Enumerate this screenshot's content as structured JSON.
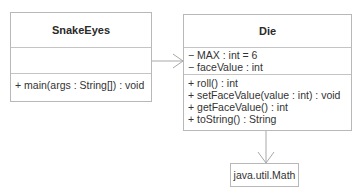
{
  "diagram": {
    "type": "UML class diagram",
    "classes": [
      {
        "name": "SnakeEyes",
        "attributes": [],
        "operations": [
          "+ main(args : String[]) : void"
        ]
      },
      {
        "name": "Die",
        "attributes": [
          "− MAX : int = 6",
          "− faceValue : int"
        ],
        "operations": [
          "+ roll() : int",
          "+ setFaceValue(value : int) : void",
          "+ getFaceValue() : int",
          "+ toString() : String"
        ]
      },
      {
        "name": "java.util.Math"
      }
    ],
    "relationships": [
      {
        "from": "SnakeEyes",
        "to": "Die",
        "type": "dependency-arrow"
      },
      {
        "from": "Die",
        "to": "java.util.Math",
        "type": "dependency-arrow"
      }
    ],
    "colors": {
      "border": "#b8b8b8",
      "line": "#a8a8a8",
      "text": "#333333"
    }
  }
}
